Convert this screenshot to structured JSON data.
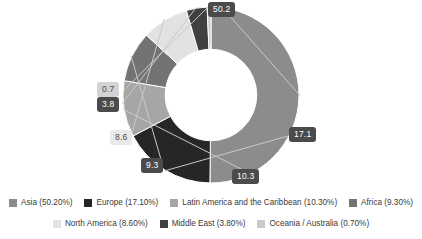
{
  "chart_data": {
    "type": "pie",
    "variant": "donut",
    "title": "",
    "subtitle": "",
    "xlabel": "",
    "ylabel": "",
    "grid": false,
    "legend_position": "bottom",
    "start_angle_deg": 0,
    "direction": "clockwise",
    "inner_radius_ratio": 0.52,
    "units": "percent",
    "categories": [
      "Asia",
      "Europe",
      "Latin America and the Caribbean",
      "Africa",
      "North America",
      "Middle East",
      "Oceania / Australia"
    ],
    "values": [
      50.2,
      17.1,
      10.3,
      9.3,
      8.6,
      3.8,
      0.7
    ],
    "data_labels": [
      "50.2",
      "17.1",
      "10.3",
      "9.3",
      "8.6",
      "3.8",
      "0.7"
    ],
    "colors": [
      "#8c8c8c",
      "#262626",
      "#a6a6a6",
      "#737373",
      "#e2e2e2",
      "#404040",
      "#c9c9c9"
    ],
    "legend_entries": [
      "Asia (50.20%)",
      "Europe (17.10%)",
      "Latin America and the Caribbean (10.30%)",
      "Africa (9.30%)",
      "North America (8.60%)",
      "Middle East (3.80%)",
      "Oceania / Australia (0.70%)"
    ]
  },
  "callouts": {
    "asia": "50.2",
    "europe": "17.1",
    "latam": "10.3",
    "africa": "9.3",
    "north_america": "8.6",
    "middle_east": "3.8",
    "oceania": "0.7"
  },
  "legend": {
    "row1": [
      {
        "label": "Asia (50.20%)",
        "color": "#8c8c8c"
      },
      {
        "label": "Europe (17.10%)",
        "color": "#262626"
      },
      {
        "label": "Latin America and the Caribbean (10.30%)",
        "color": "#a6a6a6"
      },
      {
        "label": "Africa (9.30%)",
        "color": "#737373"
      }
    ],
    "row2": [
      {
        "label": "North America (8.60%)",
        "color": "#e2e2e2"
      },
      {
        "label": "Middle East (3.80%)",
        "color": "#404040"
      },
      {
        "label": "Oceania / Australia (0.70%)",
        "color": "#c9c9c9"
      }
    ]
  }
}
